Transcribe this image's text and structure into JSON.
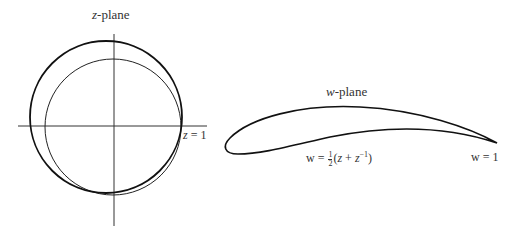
{
  "left_panel": {
    "title_var": "z",
    "title_suffix": "-plane",
    "point_label_var": "z",
    "point_label_eq": " = 1",
    "curves": [
      "original circle through z = 1",
      "unit circle"
    ]
  },
  "right_panel": {
    "title_var": "w",
    "title_suffix": "-plane",
    "map_lhs": "w = ",
    "map_frac_num": "1",
    "map_frac_den": "2",
    "map_open": "(",
    "map_z": "z",
    "map_plus": " + ",
    "map_z2": "z",
    "map_exp": "−1",
    "map_close": ")",
    "point_label": "w = 1",
    "curve": "Joukowski airfoil"
  },
  "colors": {
    "line": "#1a1a1a",
    "axis": "#333333"
  }
}
